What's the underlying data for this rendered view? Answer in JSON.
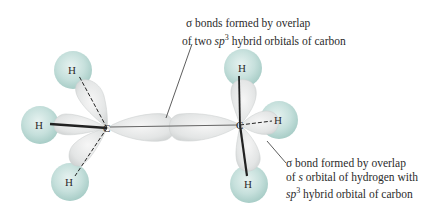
{
  "diagram": {
    "atoms": {
      "carbon_left": "C",
      "carbon_right": "C",
      "h_left_top": "H",
      "h_left_side": "H",
      "h_left_bottom": "H",
      "h_right_top": "H",
      "h_right_side": "H",
      "h_right_bottom": "H"
    },
    "annotations": {
      "cc_bond": {
        "line1": "σ bonds formed by overlap",
        "line2_pre": "of two ",
        "line2_sp": "sp",
        "line2_sup": "3",
        "line2_post": " hybrid orbitals of carbon"
      },
      "ch_bond": {
        "line1": "σ bond formed by overlap",
        "line2_pre": "of ",
        "line2_s": "s",
        "line2_post": " orbital of hydrogen with",
        "line3_sp": "sp",
        "line3_sup": "3",
        "line3_post": " hybrid orbital of carbon"
      }
    },
    "colors": {
      "hydrogen_sphere": "#bfdcd8",
      "hydrogen_sphere_edge": "#a9cdc8",
      "orbital_lobe": "#e4e6e6",
      "orbital_edge": "#c9cccc",
      "bond_line": "#222222",
      "text": "#2b2b2b"
    }
  }
}
